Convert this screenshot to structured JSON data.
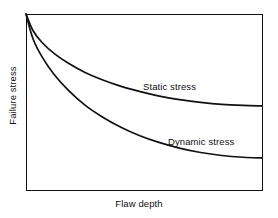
{
  "figure": {
    "title": "",
    "background_color": "#ffffff",
    "line_color": "#111111",
    "axis_color": "#111111"
  },
  "axes": {
    "xlabel": "Flaw depth",
    "ylabel": "Failure stress",
    "frame": {
      "left": 26,
      "top": 14,
      "right": 262,
      "bottom": 190
    },
    "ticks_visible": false,
    "grid": false
  },
  "annotations": {
    "static_label": "Static stress",
    "dynamic_label": "Dynamic stress"
  },
  "chart_data": {
    "type": "line",
    "title": "",
    "xlabel": "Flaw depth",
    "ylabel": "Failure stress",
    "xlim": [
      0,
      1
    ],
    "ylim": [
      0,
      1
    ],
    "grid": false,
    "legend_position": "inline-annotations",
    "axis_tick_labels": {
      "x": [],
      "y": []
    },
    "series": [
      {
        "name": "Static stress",
        "color": "#111111",
        "annotation": "Static stress",
        "x": [
          0.0,
          0.03,
          0.07,
          0.12,
          0.18,
          0.25,
          0.32,
          0.4,
          0.48,
          0.56,
          0.65,
          0.74,
          0.83,
          0.92,
          1.0
        ],
        "y": [
          1.0,
          0.905,
          0.835,
          0.775,
          0.72,
          0.668,
          0.628,
          0.59,
          0.56,
          0.535,
          0.513,
          0.498,
          0.487,
          0.481,
          0.478
        ]
      },
      {
        "name": "Dynamic stress",
        "color": "#111111",
        "annotation": "Dynamic stress",
        "x": [
          0.0,
          0.03,
          0.07,
          0.12,
          0.18,
          0.25,
          0.32,
          0.4,
          0.48,
          0.56,
          0.65,
          0.74,
          0.83,
          0.92,
          1.0
        ],
        "y": [
          1.0,
          0.858,
          0.752,
          0.655,
          0.566,
          0.482,
          0.418,
          0.358,
          0.31,
          0.272,
          0.238,
          0.213,
          0.196,
          0.186,
          0.182
        ]
      }
    ]
  }
}
